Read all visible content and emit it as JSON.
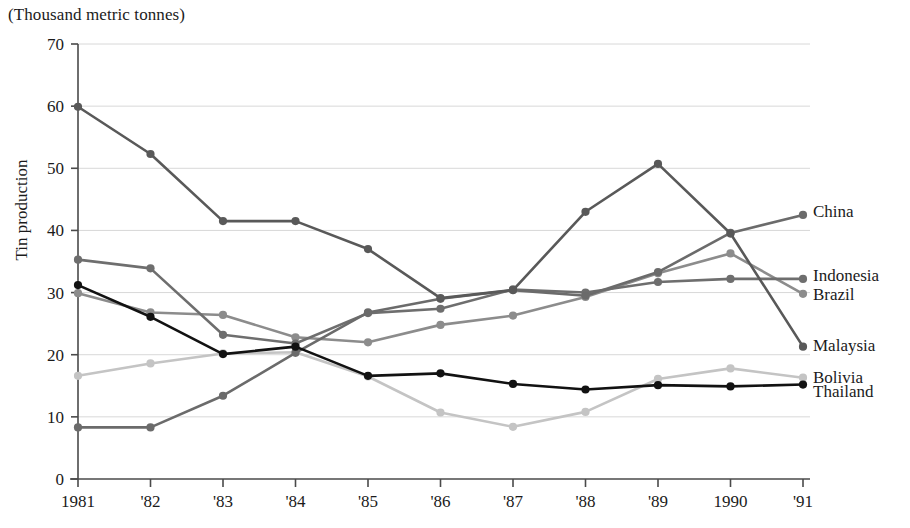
{
  "chart_data": {
    "type": "line",
    "title": "(Thousand metric tonnes)",
    "xlabel": "",
    "ylabel": "Tin production",
    "categories": [
      "1981",
      "'82",
      "'83",
      "'84",
      "'85",
      "'86",
      "'87",
      "'88",
      "'89",
      "1990",
      "'91"
    ],
    "x_tick_labels": [
      "1981",
      "'82",
      "'83",
      "'84",
      "'85",
      "'86",
      "'87",
      "'88",
      "'89",
      "1990",
      "'91"
    ],
    "y_tick_labels": [
      "0",
      "10",
      "20",
      "30",
      "40",
      "50",
      "60",
      "70"
    ],
    "y_ticks": [
      0,
      10,
      20,
      30,
      40,
      50,
      60,
      70
    ],
    "ylim": [
      0,
      70
    ],
    "grid": true,
    "legend_position": "right-inline-end-of-line",
    "series": [
      {
        "name": "Malaysia",
        "color": "#595959",
        "values": [
          59.9,
          52.3,
          41.5,
          41.5,
          37.0,
          29.1,
          30.4,
          43.0,
          50.7,
          39.5,
          21.3
        ]
      },
      {
        "name": "Indonesia",
        "color": "#6e6e6e",
        "values": [
          35.3,
          33.9,
          23.2,
          21.8,
          26.7,
          27.4,
          30.5,
          30.0,
          31.7,
          32.2,
          32.2
        ]
      },
      {
        "name": "Thailand",
        "color": "#121212",
        "values": [
          31.2,
          26.1,
          20.1,
          21.3,
          16.6,
          17.0,
          15.3,
          14.4,
          15.1,
          14.9,
          15.2
        ]
      },
      {
        "name": "Brazil",
        "color": "#8c8c8c",
        "values": [
          29.9,
          26.8,
          26.4,
          22.8,
          22.0,
          24.8,
          26.3,
          29.3,
          33.1,
          36.3,
          29.8
        ]
      },
      {
        "name": "Bolivia",
        "color": "#c4c4c4",
        "values": [
          16.6,
          18.6,
          20.2,
          20.4,
          16.5,
          10.7,
          8.4,
          10.8,
          16.1,
          17.8,
          16.3
        ]
      },
      {
        "name": "China",
        "color": "#6b6b6b",
        "values": [
          8.3,
          8.3,
          13.4,
          20.3,
          26.8,
          29.0,
          30.4,
          29.5,
          33.3,
          39.6,
          42.5
        ]
      }
    ]
  },
  "legend": {
    "entries": [
      {
        "label": "China"
      },
      {
        "label": "Indonesia"
      },
      {
        "label": "Brazil"
      },
      {
        "label": "Malaysia"
      },
      {
        "label": "Bolivia"
      },
      {
        "label": "Thailand"
      }
    ]
  },
  "axis": {
    "unit_note": "(Thousand metric tonnes)",
    "y_title": "Tin production"
  }
}
